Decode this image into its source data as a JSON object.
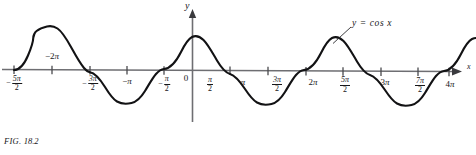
{
  "figure": {
    "caption_prefix": "FIG.",
    "caption_number": "18.2",
    "curve_label": "y  =  cos x",
    "axis_x_name": "x",
    "axis_y_name": "y",
    "origin_label": "0"
  },
  "chart_data": {
    "type": "line",
    "title": "",
    "subtitle": "",
    "xlabel": "x",
    "ylabel": "y",
    "function": "y = cos x",
    "legend": [
      "y = cos x"
    ],
    "legend_position": "inline-annotation-upper-right",
    "grid": false,
    "xlim_pi": [
      -2.5,
      4.25
    ],
    "ylim": [
      -1.35,
      1.35
    ],
    "amplitude": 1,
    "period_pi": 2,
    "x_tick_labels": [
      "-5π/2",
      "-2π",
      "-3π/2",
      "-π",
      "-π/2",
      "0",
      "π/2",
      "π",
      "3π/2",
      "2π",
      "5π/2",
      "3π",
      "7π/2",
      "4π"
    ],
    "x_tick_values_pi": [
      -2.5,
      -2,
      -1.5,
      -1,
      -0.5,
      0,
      0.5,
      1,
      1.5,
      2,
      2.5,
      3,
      3.5,
      4
    ],
    "y_tick_labels": [],
    "zeros_pi": [
      -2.5,
      -1.5,
      -0.5,
      0.5,
      1.5,
      2.5,
      3.5
    ],
    "maxima_pi": [
      -2,
      0,
      2,
      4
    ],
    "minima_pi": [
      -1,
      1,
      3
    ],
    "x": [
      -2.5,
      -2.375,
      -2.25,
      -2.125,
      -2.0,
      -1.875,
      -1.75,
      -1.625,
      -1.5,
      -1.375,
      -1.25,
      -1.125,
      -1.0,
      -0.875,
      -0.75,
      -0.625,
      -0.5,
      -0.375,
      -0.25,
      -0.125,
      0.0,
      0.125,
      0.25,
      0.375,
      0.5,
      0.625,
      0.75,
      0.875,
      1.0,
      1.125,
      1.25,
      1.375,
      1.5,
      1.625,
      1.75,
      1.875,
      2.0,
      2.125,
      2.25,
      2.375,
      2.5,
      2.625,
      2.75,
      2.875,
      3.0,
      3.125,
      3.25,
      3.375,
      3.5,
      3.625,
      3.75,
      3.875,
      4.0,
      4.125,
      4.25
    ],
    "y": [
      0.0,
      0.383,
      0.707,
      0.924,
      1.0,
      0.924,
      0.707,
      0.383,
      0.0,
      -0.383,
      -0.707,
      -0.924,
      -1.0,
      -0.924,
      -0.707,
      -0.383,
      0.0,
      0.383,
      0.707,
      0.924,
      1.0,
      0.924,
      0.707,
      0.383,
      0.0,
      -0.383,
      -0.707,
      -0.924,
      -1.0,
      -0.924,
      -0.707,
      -0.383,
      0.0,
      0.383,
      0.707,
      0.924,
      1.0,
      0.924,
      0.707,
      0.383,
      0.0,
      -0.383,
      -0.707,
      -0.924,
      -1.0,
      -0.924,
      -0.707,
      -0.383,
      0.0,
      0.383,
      0.707,
      0.924,
      1.0,
      0.924,
      0.707
    ]
  },
  "ticks": [
    {
      "id": "t-neg5pi2",
      "type": "fraction",
      "sign": "−",
      "num": "5π",
      "den": "2",
      "px": 14
    },
    {
      "id": "t-neg2pi",
      "type": "plain",
      "text": "−2π",
      "px": 52
    },
    {
      "id": "t-neg3pi2",
      "type": "fraction",
      "sign": "−",
      "num": "3π",
      "den": "2",
      "px": 90
    },
    {
      "id": "t-negpi",
      "type": "plain",
      "text": "−π",
      "px": 127
    },
    {
      "id": "t-negpi2",
      "type": "fraction",
      "sign": "−",
      "num": "π",
      "den": "2",
      "px": 164
    },
    {
      "id": "t-zero",
      "type": "plain",
      "text": "0",
      "px": 199
    },
    {
      "id": "t-pi2",
      "type": "fraction",
      "sign": "",
      "num": "π",
      "den": "2",
      "px": 230
    },
    {
      "id": "t-pi",
      "type": "plain",
      "text": "π",
      "px": 268
    },
    {
      "id": "t-3pi2",
      "type": "fraction",
      "sign": "",
      "num": "3π",
      "den": "2",
      "px": 306
    },
    {
      "id": "t-2pi",
      "type": "plain",
      "text": "2π",
      "px": 343
    },
    {
      "id": "t-5pi2",
      "type": "fraction",
      "sign": "",
      "num": "5π",
      "den": "2",
      "px": 381
    },
    {
      "id": "t-3pi",
      "type": "plain",
      "text": "3π",
      "px": 418
    },
    {
      "id": "t-7pi2",
      "type": "fraction",
      "sign": "",
      "num": "7π",
      "den": "2",
      "px": 456
    },
    {
      "id": "t-4pi",
      "type": "plain",
      "text": "4π",
      "px": 456
    }
  ],
  "colors": {
    "background": "#ffffff",
    "curve": "#121214",
    "axis": "#6e6e72",
    "text": "#17171a"
  }
}
